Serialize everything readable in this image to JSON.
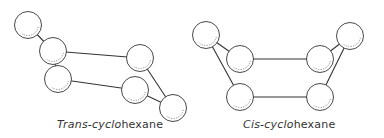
{
  "diagram": {
    "colors": {
      "stroke": "#333333",
      "background": "#ffffff"
    },
    "molecules": [
      {
        "id": "trans",
        "caption_italic": "Trans-cyclo",
        "caption_plain": "hexane",
        "atoms": [
          "carbon-1",
          "carbon-2",
          "carbon-3",
          "carbon-4",
          "carbon-5",
          "carbon-6"
        ],
        "bonds": [
          [
            "carbon-1",
            "carbon-2"
          ],
          [
            "carbon-2",
            "carbon-3"
          ],
          [
            "carbon-3",
            "carbon-5"
          ],
          [
            "carbon-2",
            "carbon-4"
          ],
          [
            "carbon-4",
            "carbon-6"
          ],
          [
            "carbon-5",
            "carbon-6"
          ]
        ]
      },
      {
        "id": "cis",
        "caption_italic": "Cis-cyclo",
        "caption_plain": "hexane",
        "atoms": [
          "carbon-1",
          "carbon-2",
          "carbon-3",
          "carbon-4",
          "carbon-5",
          "carbon-6"
        ],
        "bonds": [
          [
            "carbon-1",
            "carbon-2"
          ],
          [
            "carbon-1",
            "carbon-5"
          ],
          [
            "carbon-2",
            "carbon-3"
          ],
          [
            "carbon-3",
            "carbon-4"
          ],
          [
            "carbon-4",
            "carbon-6"
          ],
          [
            "carbon-5",
            "carbon-6"
          ]
        ]
      }
    ]
  }
}
